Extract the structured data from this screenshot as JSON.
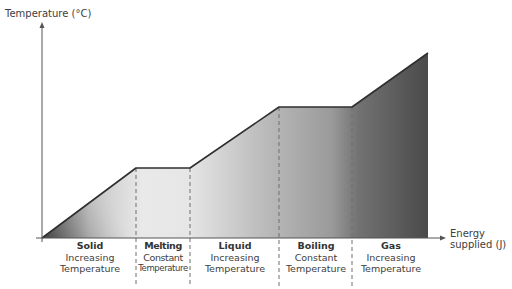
{
  "axes": {
    "y_label": "Temperature (°C)",
    "x_label_line1": "Energy",
    "x_label_line2": "supplied (J)"
  },
  "phases": [
    {
      "name": "Solid",
      "line1": "Increasing",
      "line2": "Temperature"
    },
    {
      "name": "Melting",
      "line1": "Constant",
      "line2": "Temperature"
    },
    {
      "name": "Liquid",
      "line1": "Increasing",
      "line2": "Temperature"
    },
    {
      "name": "Boiling",
      "line1": "Constant",
      "line2": "Temperature"
    },
    {
      "name": "Gas",
      "line1": "Increasing",
      "line2": "Temperature"
    }
  ],
  "curve_points": [
    [
      42,
      238
    ],
    [
      136,
      168
    ],
    [
      190,
      168
    ],
    [
      279,
      107
    ],
    [
      352,
      107
    ],
    [
      428,
      53
    ]
  ],
  "phase_boundaries_x": [
    136,
    190,
    279,
    352
  ],
  "colors": {
    "line": "#2f2f2f",
    "fill_light": "#ececec",
    "fill_dark": "#4a4a4a",
    "axis": "#555555",
    "dash": "#777777"
  }
}
